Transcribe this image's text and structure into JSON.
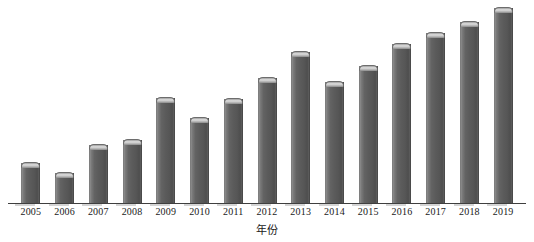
{
  "chart_data": {
    "type": "bar",
    "title": "",
    "subtitle": "",
    "xlabel": "年份",
    "ylabel": "",
    "grid": false,
    "legend": "none",
    "axis_visible": {
      "x": true,
      "y": false
    },
    "ylim": [
      0,
      100
    ],
    "categories": [
      "2005",
      "2006",
      "2007",
      "2008",
      "2009",
      "2010",
      "2011",
      "2012",
      "2013",
      "2014",
      "2015",
      "2016",
      "2017",
      "2018",
      "2019"
    ],
    "values": [
      20.5,
      15.4,
      29.7,
      32.3,
      53.8,
      43.6,
      53.3,
      64.1,
      77.4,
      62.1,
      70.3,
      81.5,
      87.2,
      92.8,
      100.0
    ],
    "series": [
      {
        "name": "数量",
        "values": [
          20.5,
          15.4,
          29.7,
          32.3,
          53.8,
          43.6,
          53.3,
          64.1,
          77.4,
          62.1,
          70.3,
          81.5,
          87.2,
          92.8,
          100.0
        ]
      }
    ],
    "bar_style": "cylinder-3d",
    "colors": {
      "bar_body": "#5b5b5b",
      "bar_cap": "#dcdcdc",
      "bar_edge_light": "#8d8d8d",
      "bar_edge_dark": "#4a4a4a",
      "axis": "#3f3f3f",
      "text": "#1a1a1a",
      "background": "#ffffff"
    }
  }
}
